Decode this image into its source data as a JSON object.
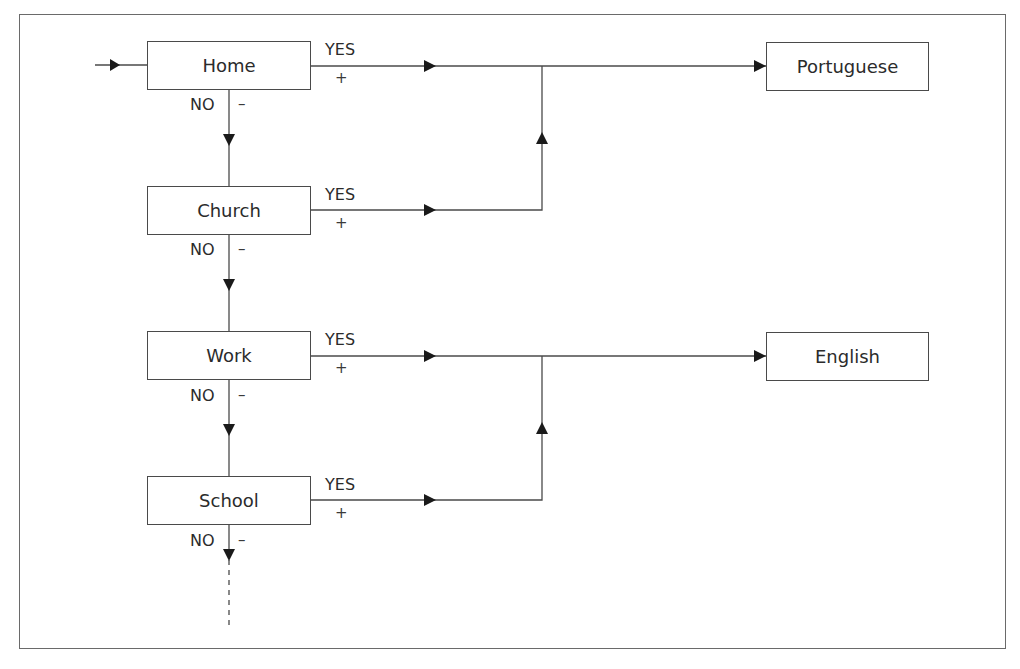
{
  "diagram": {
    "type": "flowchart",
    "decisions": [
      {
        "label": "Home",
        "yes_label": "YES",
        "yes_sign": "+",
        "no_label": "NO",
        "no_sign": "–",
        "leads_to": "Portuguese"
      },
      {
        "label": "Church",
        "yes_label": "YES",
        "yes_sign": "+",
        "no_label": "NO",
        "no_sign": "–",
        "leads_to": "Portuguese"
      },
      {
        "label": "Work",
        "yes_label": "YES",
        "yes_sign": "+",
        "no_label": "NO",
        "no_sign": "–",
        "leads_to": "English"
      },
      {
        "label": "School",
        "yes_label": "YES",
        "yes_sign": "+",
        "no_label": "NO",
        "no_sign": "–",
        "leads_to": "English"
      }
    ],
    "outcomes": [
      {
        "label": "Portuguese"
      },
      {
        "label": "English"
      }
    ],
    "continuation": "dashed"
  }
}
